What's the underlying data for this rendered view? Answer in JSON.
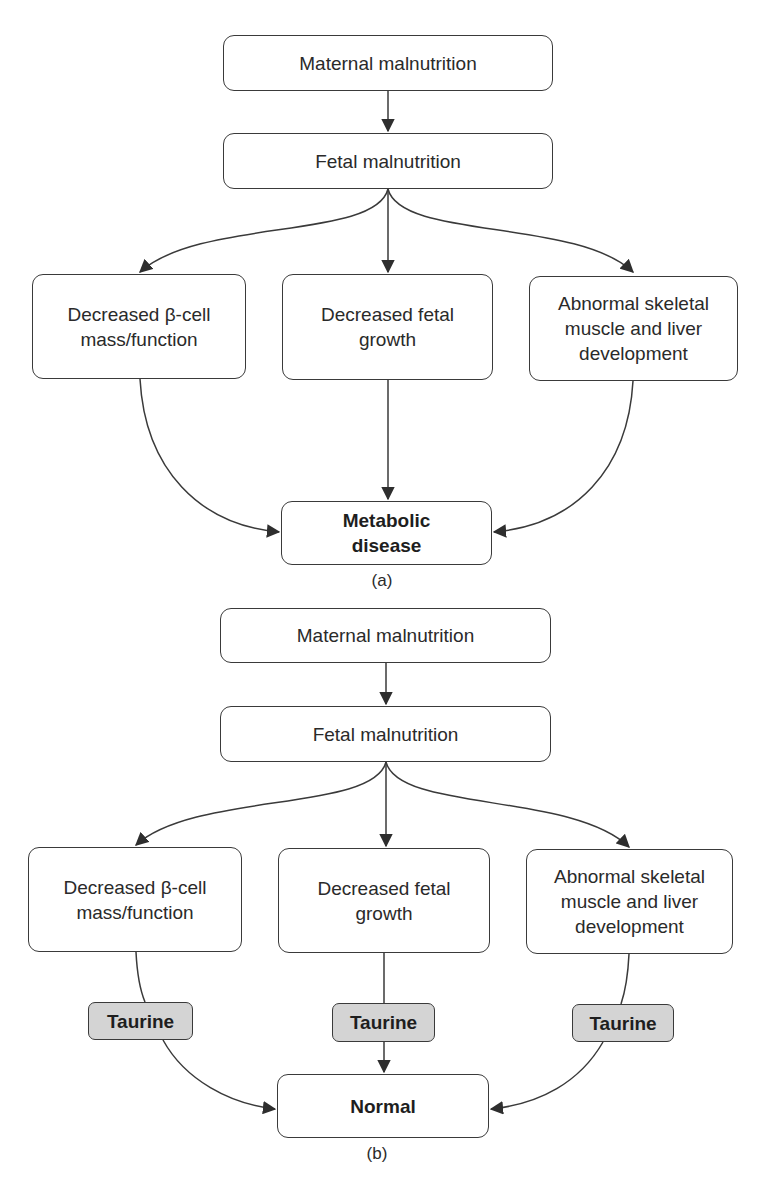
{
  "panel_a": {
    "caption": "(a)",
    "nodes": {
      "maternal": "Maternal malnutrition",
      "fetal": "Fetal malnutrition",
      "beta_cell": "Decreased β-cell\nmass/function",
      "fetal_growth": "Decreased fetal\ngrowth",
      "skeletal": "Abnormal skeletal\nmuscle and liver\ndevelopment",
      "outcome": "Metabolic\ndisease"
    }
  },
  "panel_b": {
    "caption": "(b)",
    "nodes": {
      "maternal": "Maternal malnutrition",
      "fetal": "Fetal malnutrition",
      "beta_cell": "Decreased β-cell\nmass/function",
      "fetal_growth": "Decreased fetal\ngrowth",
      "skeletal": "Abnormal skeletal\nmuscle and liver\ndevelopment",
      "taurine_left": "Taurine",
      "taurine_middle": "Taurine",
      "taurine_right": "Taurine",
      "outcome": "Normal"
    }
  },
  "colors": {
    "stroke": "#3a3a3a",
    "node_fill": "#ffffff",
    "taurine_fill": "#d4d4d4"
  }
}
